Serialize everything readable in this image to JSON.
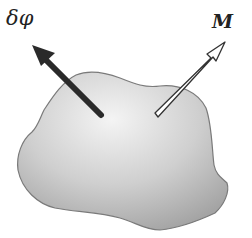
{
  "diagram": {
    "labels": {
      "variation": "δφ",
      "moment": "M"
    },
    "elements": [
      {
        "type": "body",
        "shape": "irregular blob",
        "fill": "gradient gray"
      },
      {
        "type": "arrow",
        "style": "solid black",
        "label": "δφ",
        "direction": "up-left"
      },
      {
        "type": "arrow",
        "style": "hollow white",
        "label": "M",
        "direction": "up-right"
      }
    ],
    "colors": {
      "body_light": "#f2f2f2",
      "body_dark": "#a8a8a8",
      "arrow_dark": "#2a2a2a",
      "outline": "#777777"
    }
  }
}
